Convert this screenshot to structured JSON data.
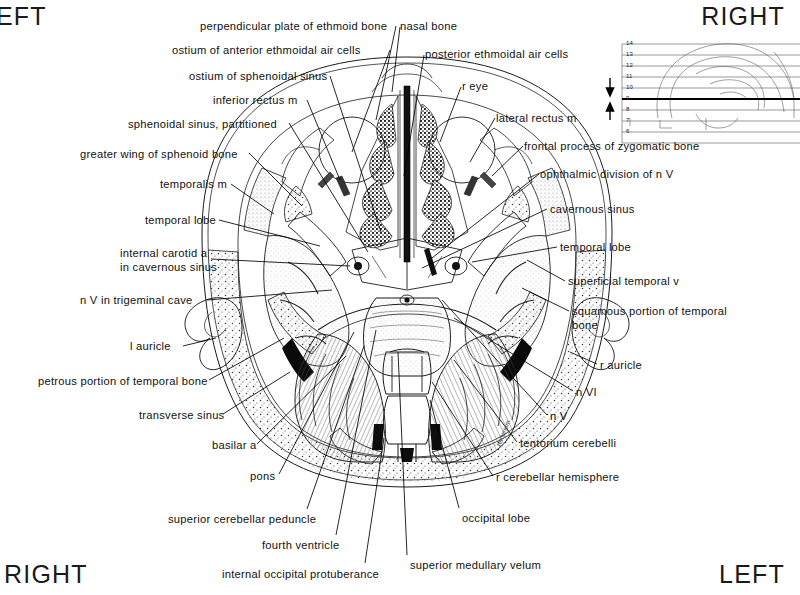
{
  "plate": {
    "type": "axial-cross-section-anatomical-atlas",
    "description": "Axial (transverse) section through the head at the level of the sphenoid sinus, orbits and posterior fossa"
  },
  "orientation": {
    "top_left": "EFT",
    "top_left_full": "LEFT",
    "top_right": "RIGHT",
    "bottom_left": "RIGHT",
    "bottom_right": "LEFT"
  },
  "key_inset": {
    "name": "lateral-skull-level-key",
    "levels": [
      "14",
      "13",
      "12",
      "11",
      "10",
      "9",
      "8",
      "7",
      "6"
    ],
    "current_level": "9",
    "arrow_count": 2
  },
  "labels_top": [
    {
      "text": "perpendicular plate of ethmoid bone",
      "x": 200,
      "y": 20,
      "align": "left",
      "lx": 396,
      "ly": 26,
      "tx": 372,
      "ty": 120
    },
    {
      "text": "nasal bone",
      "x": 400,
      "y": 20,
      "align": "left",
      "lx": 398,
      "ly": 27,
      "tx": 391,
      "ty": 90
    },
    {
      "text": "ostium of anterior ethmoidal air cells",
      "x": 172,
      "y": 44,
      "align": "left",
      "lx": 390,
      "ly": 50,
      "tx": 350,
      "ty": 150
    },
    {
      "text": "posterior ethmoidal air cells",
      "x": 425,
      "y": 48,
      "align": "left",
      "lx": 423,
      "ly": 55,
      "tx": 404,
      "ty": 175
    },
    {
      "text": "ostium of sphenoidal sinus",
      "x": 189,
      "y": 70,
      "align": "left",
      "lx": 330,
      "ly": 76,
      "tx": 381,
      "ty": 232
    },
    {
      "text": "inferior rectus m",
      "x": 213,
      "y": 94,
      "align": "left",
      "lx": 307,
      "ly": 100,
      "tx": 340,
      "ty": 178
    },
    {
      "text": "r eye",
      "x": 462,
      "y": 80,
      "align": "left",
      "lx": 460,
      "ly": 87,
      "tx": 437,
      "ty": 140
    },
    {
      "text": "lateral rectus m",
      "x": 496,
      "y": 112,
      "align": "left",
      "lx": 494,
      "ly": 118,
      "tx": 467,
      "ty": 160
    },
    {
      "text": "sphenoidal sinus, partitioned",
      "x": 128,
      "y": 118,
      "align": "left",
      "lx": 288,
      "ly": 123,
      "tx": 368,
      "ty": 250
    },
    {
      "text": "frontal process of zygomatic bone",
      "x": 524,
      "y": 140,
      "align": "left",
      "lx": 522,
      "ly": 146,
      "tx": 490,
      "ty": 175
    },
    {
      "text": "greater wing of sphenoid bone",
      "x": 80,
      "y": 148,
      "align": "left",
      "lx": 248,
      "ly": 153,
      "tx": 300,
      "ty": 205
    },
    {
      "text": "ophthalmic division of n V",
      "x": 540,
      "y": 168,
      "align": "left",
      "lx": 538,
      "ly": 174,
      "tx": 430,
      "ty": 258
    }
  ],
  "labels_left": [
    {
      "text": "temporalis m",
      "x": 160,
      "y": 178,
      "lx": 231,
      "ly": 184,
      "tx": 272,
      "ty": 214
    },
    {
      "text": "temporal lobe",
      "x": 145,
      "y": 214,
      "lx": 219,
      "ly": 220,
      "tx": 318,
      "ty": 245
    },
    {
      "text": "internal carotid a",
      "x": 120,
      "y": 247,
      "lx": 210,
      "ly": 259,
      "tx": 358,
      "ty": 265
    },
    {
      "text": "in cavernous sinus",
      "x": 120,
      "y": 261,
      "lx": 0,
      "ly": 0,
      "tx": 0,
      "ty": 0
    },
    {
      "text": "n V in trigeminal cave",
      "x": 80,
      "y": 294,
      "lx": 206,
      "ly": 300,
      "tx": 330,
      "ty": 290
    },
    {
      "text": "l auricle",
      "x": 130,
      "y": 340,
      "lx": 182,
      "ly": 346,
      "tx": 216,
      "ty": 337
    },
    {
      "text": "petrous portion of temporal bone",
      "x": 38,
      "y": 375,
      "lx": 208,
      "ly": 380,
      "tx": 282,
      "ty": 338
    },
    {
      "text": "transverse sinus",
      "x": 139,
      "y": 409,
      "lx": 222,
      "ly": 414,
      "tx": 290,
      "ty": 372
    },
    {
      "text": "basilar a",
      "x": 212,
      "y": 439,
      "lx": 256,
      "ly": 444,
      "tx": 344,
      "ty": 355
    },
    {
      "text": "pons",
      "x": 250,
      "y": 470,
      "lx": 278,
      "ly": 474,
      "tx": 352,
      "ty": 330
    },
    {
      "text": "superior cerebellar peduncle",
      "x": 168,
      "y": 513,
      "lx": 306,
      "ly": 509,
      "tx": 362,
      "ty": 345
    },
    {
      "text": "fourth ventricle",
      "x": 262,
      "y": 539,
      "lx": 335,
      "ly": 535,
      "tx": 374,
      "ty": 330
    },
    {
      "text": "internal occipital protuberance",
      "x": 222,
      "y": 568,
      "lx": 364,
      "ly": 563,
      "tx": 383,
      "ty": 438
    }
  ],
  "labels_right": [
    {
      "text": "cavernous sinus",
      "x": 550,
      "y": 203,
      "lx": 548,
      "ly": 209,
      "tx": 420,
      "ty": 268
    },
    {
      "text": "temporal lobe",
      "x": 560,
      "y": 241,
      "lx": 558,
      "ly": 247,
      "tx": 470,
      "ty": 262
    },
    {
      "text": "superficial temporal v",
      "x": 568,
      "y": 275,
      "lx": 566,
      "ly": 281,
      "tx": 525,
      "ty": 260
    },
    {
      "text": "squamous portion of temporal",
      "x": 572,
      "y": 305,
      "lx": 570,
      "ly": 311,
      "tx": 520,
      "ty": 288
    },
    {
      "text": "bone",
      "x": 572,
      "y": 319,
      "lx": 0,
      "ly": 0,
      "tx": 0,
      "ty": 0
    },
    {
      "text": "r auricle",
      "x": 600,
      "y": 359,
      "lx": 598,
      "ly": 364,
      "tx": 568,
      "ty": 352
    },
    {
      "text": "n VI",
      "x": 576,
      "y": 386,
      "lx": 574,
      "ly": 391,
      "tx": 452,
      "ty": 318
    },
    {
      "text": "n V",
      "x": 550,
      "y": 410,
      "lx": 548,
      "ly": 415,
      "tx": 440,
      "ty": 300
    },
    {
      "text": "tentorium cerebelli",
      "x": 520,
      "y": 437,
      "lx": 518,
      "ly": 442,
      "tx": 452,
      "ty": 360
    },
    {
      "text": "r cerebellar hemisphere",
      "x": 496,
      "y": 471,
      "lx": 494,
      "ly": 476,
      "tx": 430,
      "ty": 380
    },
    {
      "text": "occipital lobe",
      "x": 462,
      "y": 512,
      "lx": 460,
      "ly": 508,
      "tx": 428,
      "ty": 400
    },
    {
      "text": "superior medullary velum",
      "x": 410,
      "y": 559,
      "lx": 408,
      "ly": 555,
      "tx": 396,
      "ty": 352
    }
  ],
  "inline_text": {
    "tentorium_edge": "tentorium"
  }
}
